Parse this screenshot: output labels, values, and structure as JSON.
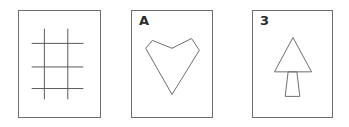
{
  "canvas": {
    "width": 349,
    "height": 127,
    "background_color": "#ffffff"
  },
  "style": {
    "card_border_color": "#6e6e6e",
    "card_fill_color": "#ffffff",
    "figure_stroke_color": "#6e6e6e",
    "label_text_color": "#2b2b2b"
  },
  "cards": [
    {
      "id": "grid",
      "label": "",
      "figure_name": "grid-hash-figure",
      "figure_description": "tic-tac-toe grid of two vertical and three horizontal lines",
      "bounds": {
        "x": 18,
        "y": 10,
        "width": 83,
        "height": 108
      },
      "geometry": {
        "vertical_lines_x": [
          44,
          68
        ],
        "vertical_extent_y": [
          28,
          100
        ],
        "horizontal_lines_y": [
          43,
          67,
          89
        ],
        "horizontal_extent_x": [
          31,
          84
        ]
      }
    },
    {
      "id": "heart",
      "label": "A",
      "figure_name": "heart-polygon-figure",
      "figure_description": "closed six-vertex heart shaped outline with a notch at the top",
      "bounds": {
        "x": 131,
        "y": 10,
        "width": 82,
        "height": 108
      },
      "geometry": {
        "points": [
          [
            152,
            40
          ],
          [
            172,
            48
          ],
          [
            192,
            38
          ],
          [
            200,
            50
          ],
          [
            172,
            95
          ],
          [
            145,
            48
          ]
        ]
      }
    },
    {
      "id": "tree",
      "label": "3",
      "figure_name": "tree-arrow-figure",
      "figure_description": "triangle above a trapezoid trunk forming a tree or arrow",
      "bounds": {
        "x": 252,
        "y": 10,
        "width": 81,
        "height": 108
      },
      "geometry": {
        "triangle_points": [
          [
            293,
            37
          ],
          [
            312,
            72
          ],
          [
            274,
            72
          ]
        ],
        "trunk_points": [
          [
            288,
            72
          ],
          [
            297,
            72
          ],
          [
            300,
            97
          ],
          [
            285,
            97
          ]
        ]
      }
    }
  ]
}
